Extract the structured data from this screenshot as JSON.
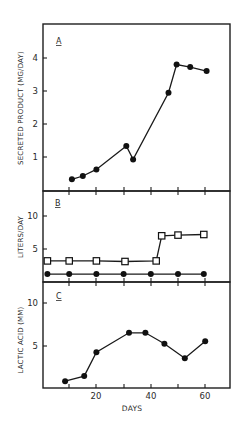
{
  "chart_data": [
    {
      "panel": "A",
      "type": "line",
      "title": "",
      "xlabel": "",
      "ylabel": "SECRETED PRODUCT (MG/DAY)",
      "xlim": [
        0,
        68
      ],
      "ylim": [
        0,
        5
      ],
      "yticks": [
        1,
        2,
        3,
        4
      ],
      "ytick_labels": [
        "1",
        "2",
        "3",
        "4"
      ],
      "xticks": [
        10,
        20,
        30,
        40,
        50,
        60
      ],
      "grid": false,
      "series": [
        {
          "name": "secreted product",
          "marker": "filled-circle",
          "x": [
            11,
            15,
            20,
            31,
            33.5,
            46.5,
            49.5,
            54.5,
            60.5
          ],
          "y": [
            0.35,
            0.45,
            0.65,
            1.35,
            0.95,
            2.95,
            3.8,
            3.72,
            3.6
          ]
        }
      ]
    },
    {
      "panel": "B",
      "type": "line",
      "title": "",
      "xlabel": "",
      "ylabel": "LITERS/DAY",
      "xlim": [
        0,
        68
      ],
      "ylim": [
        0,
        13.5
      ],
      "yticks": [
        5,
        10
      ],
      "ytick_labels": [
        "5",
        "10"
      ],
      "xticks": [
        10,
        20,
        30,
        40,
        50,
        60
      ],
      "grid": false,
      "series": [
        {
          "name": "open squares",
          "marker": "open-square",
          "x": [
            2,
            10,
            20,
            30.5,
            42,
            44,
            50,
            59.5
          ],
          "y": [
            3.2,
            3.2,
            3.2,
            3.1,
            3.2,
            7.0,
            7.1,
            7.2
          ]
        },
        {
          "name": "filled circles",
          "marker": "filled-circle",
          "x": [
            2,
            10,
            20,
            30,
            40,
            50,
            59.5
          ],
          "y": [
            1.2,
            1.2,
            1.2,
            1.2,
            1.2,
            1.2,
            1.2
          ]
        }
      ]
    },
    {
      "panel": "C",
      "type": "line",
      "title": "",
      "xlabel": "DAYS",
      "ylabel": "LACTIC ACID (MM)",
      "xlim": [
        0,
        68
      ],
      "ylim": [
        0,
        12.3
      ],
      "yticks": [
        5,
        10
      ],
      "ytick_labels": [
        "5",
        "10"
      ],
      "xticks": [
        10,
        20,
        30,
        40,
        50,
        60
      ],
      "xtick_labels": [
        "20",
        "40",
        "60"
      ],
      "xtick_label_values": [
        20,
        40,
        60
      ],
      "grid": false,
      "series": [
        {
          "name": "lactic acid",
          "marker": "filled-circle",
          "x": [
            8.5,
            15.5,
            20,
            32,
            38,
            45,
            52.5,
            60
          ],
          "y": [
            0.8,
            1.4,
            4.2,
            6.5,
            6.5,
            5.2,
            3.5,
            5.5
          ]
        }
      ]
    }
  ],
  "labels": {
    "panel_a_marker": "A",
    "panel_b_marker": "B",
    "panel_c_marker": "C",
    "panel_a_ylabel": "SECRETED PRODUCT (MG/DAY)",
    "panel_b_ylabel": "LITERS/DAY",
    "panel_c_ylabel": "LACTIC ACID (MM)",
    "xlabel": "DAYS",
    "a_y1": "1",
    "a_y2": "2",
    "a_y3": "3",
    "a_y4": "4",
    "b_y5": "5",
    "b_y10": "10",
    "c_y5": "5",
    "c_y10": "10",
    "x20": "20",
    "x40": "40",
    "x60": "60"
  }
}
